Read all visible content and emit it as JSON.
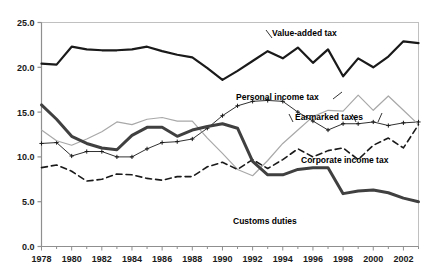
{
  "chart_data": {
    "type": "line",
    "title": "",
    "xlabel": "",
    "ylabel": "",
    "xlim": [
      1978,
      2003
    ],
    "ylim": [
      0.0,
      25.0
    ],
    "grid": false,
    "legend_position": "inline-annotations",
    "y_ticks": [
      "0.0",
      "5.0",
      "10.0",
      "15.0",
      "20.0",
      "25.0"
    ],
    "y_tick_values": [
      0.0,
      5.0,
      10.0,
      15.0,
      20.0,
      25.0
    ],
    "x_ticks": [
      "1978",
      "1980",
      "1982",
      "1984",
      "1986",
      "1988",
      "1990",
      "1992",
      "1994",
      "1996",
      "1998",
      "2000",
      "2002"
    ],
    "x_tick_values": [
      1978,
      1980,
      1982,
      1984,
      1986,
      1988,
      1990,
      1992,
      1994,
      1996,
      1998,
      2000,
      2002
    ],
    "x": [
      1978,
      1979,
      1980,
      1981,
      1982,
      1983,
      1984,
      1985,
      1986,
      1987,
      1988,
      1989,
      1990,
      1991,
      1992,
      1993,
      1994,
      1995,
      1996,
      1997,
      1998,
      1999,
      2000,
      2001,
      2002,
      2003
    ],
    "series": [
      {
        "name": "Value-added tax",
        "color": "#1a1a1a",
        "width": 2.2,
        "style": "solid",
        "marker": "none",
        "values": [
          20.4,
          20.3,
          22.3,
          22.0,
          21.9,
          21.9,
          22.0,
          22.3,
          21.8,
          21.4,
          21.1,
          19.9,
          18.6,
          19.6,
          20.7,
          21.8,
          21.0,
          22.2,
          20.5,
          22.0,
          19.0,
          21.0,
          20.0,
          21.2,
          22.9,
          22.7
        ],
        "label_x": 2000.0,
        "label_y": 24.0
      },
      {
        "name": "Personal income tax",
        "color": "#1a1a1a",
        "width": 0.9,
        "style": "solid",
        "marker": "plus",
        "values": [
          11.5,
          11.6,
          10.1,
          10.6,
          10.6,
          10.0,
          10.0,
          10.9,
          11.6,
          11.7,
          12.0,
          13.2,
          14.6,
          15.7,
          16.2,
          16.3,
          16.2,
          15.0,
          14.0,
          13.0,
          13.7,
          13.7,
          13.9,
          13.5,
          13.8,
          13.9
        ],
        "label_x": 1993.0,
        "label_y": 17.3
      },
      {
        "name": "Earmarked taxes",
        "color": "#a8a8a8",
        "width": 1.2,
        "style": "solid",
        "marker": "none",
        "values": [
          13.0,
          11.8,
          11.3,
          12.0,
          12.8,
          13.9,
          13.6,
          14.2,
          14.4,
          14.0,
          14.0,
          12.1,
          10.4,
          8.6,
          7.9,
          9.6,
          11.5,
          13.0,
          14.5,
          15.2,
          15.1,
          16.9,
          15.2,
          16.8,
          15.2,
          13.6
        ],
        "label_x": 1996.6,
        "label_y": 14.6
      },
      {
        "name": "Corporate income tax",
        "color": "#1a1a1a",
        "width": 1.6,
        "style": "dashed",
        "marker": "none",
        "values": [
          8.8,
          9.1,
          8.4,
          7.3,
          7.5,
          8.1,
          8.0,
          7.6,
          7.4,
          7.8,
          7.8,
          8.9,
          9.4,
          8.6,
          9.7,
          8.7,
          9.7,
          10.9,
          10.0,
          10.7,
          11.0,
          9.7,
          11.3,
          12.1,
          11.0,
          13.6
        ],
        "label_x": 2000.7,
        "label_y": 11.0
      },
      {
        "name": "Customs duties",
        "color": "#404040",
        "width": 3.0,
        "style": "solid",
        "marker": "none",
        "values": [
          15.8,
          14.2,
          12.3,
          11.5,
          11.0,
          10.8,
          12.4,
          13.3,
          13.3,
          12.3,
          13.0,
          13.4,
          13.7,
          13.2,
          9.5,
          8.0,
          8.0,
          8.6,
          8.8,
          8.8,
          5.9,
          6.2,
          6.3,
          6.0,
          5.4,
          5.0
        ],
        "label_x": 1996.2,
        "label_y": 4.2
      }
    ],
    "annotations": [
      {
        "text": "Value-added tax",
        "x": 272,
        "y": 36
      },
      {
        "text": "Personal income tax",
        "x": 236,
        "y": 100
      },
      {
        "text": "Earmarked taxes",
        "x": 295,
        "y": 120
      },
      {
        "text": "Corporate income tax",
        "x": 301,
        "y": 163
      },
      {
        "text": "Customs duties",
        "x": 233,
        "y": 224
      }
    ]
  }
}
